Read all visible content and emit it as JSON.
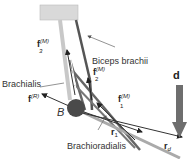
{
  "diagram": {
    "labels": {
      "biceps": "Biceps brachii",
      "brachialis": "Brachialis",
      "brachioradialis": "Brachioradialis",
      "joint": "B",
      "d": "d"
    },
    "vectors": {
      "f3": {
        "base": "f",
        "sup": "(M)",
        "sub": "3"
      },
      "f2": {
        "base": "f",
        "sup": "(M)",
        "sub": "2"
      },
      "f1": {
        "base": "f",
        "sup": "(M)",
        "sub": "1"
      },
      "fR": {
        "base": "f",
        "sup": "(R)"
      },
      "r1": {
        "base": "r",
        "sub": "1"
      },
      "rd": {
        "base": "r",
        "sub": "d"
      }
    },
    "colors": {
      "bone_box": "#d9d9d9",
      "humerus_light": "#c8c8c8",
      "muscle_dark": "#555555",
      "joint": "#4a4a4a",
      "force_arrow": "#6e6e6e"
    }
  }
}
